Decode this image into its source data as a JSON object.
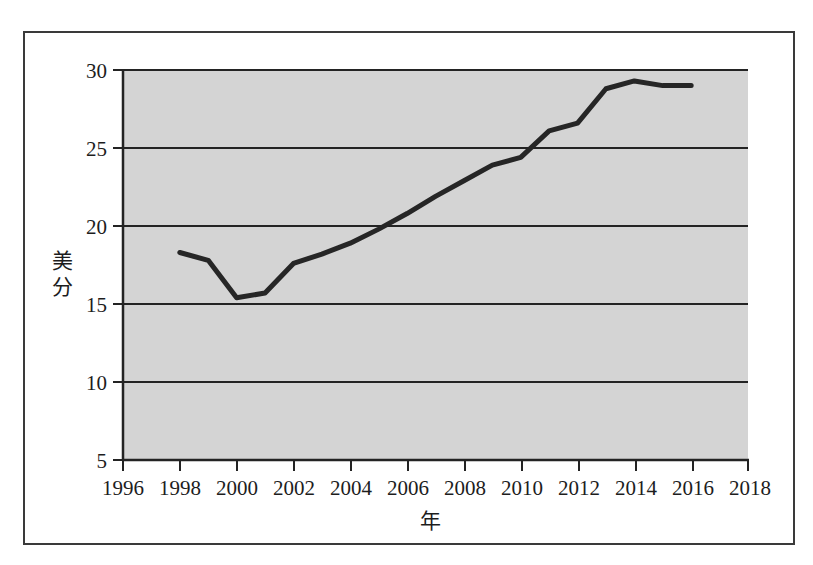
{
  "chart_data": {
    "type": "line",
    "title": "",
    "subtitle": "",
    "xlabel": "年",
    "ylabel": "美分",
    "ylabel_chars": [
      "美",
      "分"
    ],
    "xlim": [
      1996,
      2018
    ],
    "ylim": [
      5,
      30
    ],
    "grid": "horizontal",
    "legend": "none",
    "plot_background": "#d4d4d4",
    "line_color": "#262626",
    "x_ticks": [
      1996,
      1998,
      2000,
      2002,
      2004,
      2006,
      2008,
      2010,
      2012,
      2014,
      2016,
      2018
    ],
    "x_tick_labels": [
      "1996",
      "1998",
      "2000",
      "2002",
      "2004",
      "2006",
      "2008",
      "2010",
      "2012",
      "2014",
      "2016",
      "2018"
    ],
    "y_ticks": [
      5,
      10,
      15,
      20,
      25,
      30
    ],
    "y_tick_labels": [
      "5",
      "10",
      "15",
      "20",
      "25",
      "30"
    ],
    "x": [
      1998,
      1999,
      2000,
      2001,
      2002,
      2003,
      2004,
      2005,
      2006,
      2007,
      2008,
      2009,
      2010,
      2011,
      2012,
      2013,
      2014,
      2015,
      2016
    ],
    "series": [
      {
        "name": "美分",
        "values": [
          18.3,
          17.8,
          15.4,
          15.7,
          17.6,
          18.2,
          18.9,
          19.8,
          20.8,
          21.9,
          22.9,
          23.9,
          24.4,
          26.1,
          26.6,
          28.8,
          29.3,
          29.0,
          29.0
        ]
      }
    ]
  }
}
